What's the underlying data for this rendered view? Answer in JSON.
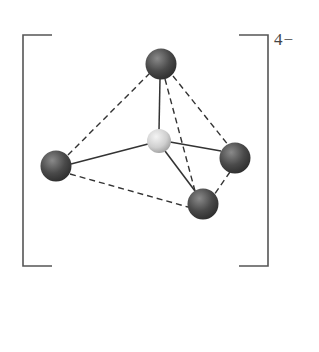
{
  "diagram": {
    "charge_label": "4−",
    "colors": {
      "bracket": "#555555",
      "bond_solid": "#333333",
      "edge_dashed": "#333333",
      "outer_atom_dark": "#2e2e2e",
      "outer_atom_light": "#8a8a8a",
      "central_atom_dark": "#9a9a9a",
      "central_atom_light": "#f2f2f2"
    },
    "atoms": [
      {
        "id": "central",
        "label": "central-atom",
        "cx": 159,
        "cy": 141,
        "r": 12
      },
      {
        "id": "top",
        "label": "ligand-top",
        "cx": 161,
        "cy": 64,
        "r": 15
      },
      {
        "id": "left",
        "label": "ligand-left",
        "cx": 56,
        "cy": 166,
        "r": 15
      },
      {
        "id": "right",
        "label": "ligand-right",
        "cx": 235,
        "cy": 158,
        "r": 15
      },
      {
        "id": "bottom",
        "label": "ligand-bottom",
        "cx": 203,
        "cy": 204,
        "r": 15
      }
    ],
    "bonds": [
      {
        "from": "central",
        "to": "top"
      },
      {
        "from": "central",
        "to": "left"
      },
      {
        "from": "central",
        "to": "right"
      },
      {
        "from": "central",
        "to": "bottom"
      }
    ],
    "edges": [
      {
        "from": "top",
        "to": "left"
      },
      {
        "from": "top",
        "to": "right"
      },
      {
        "from": "top",
        "to": "bottom"
      },
      {
        "from": "left",
        "to": "bottom"
      },
      {
        "from": "right",
        "to": "bottom"
      }
    ]
  }
}
